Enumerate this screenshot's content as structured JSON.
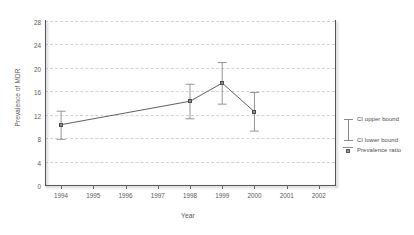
{
  "chart_data": {
    "type": "line",
    "title": "",
    "xlabel": "Year",
    "ylabel": "Prevalence of MDR",
    "x": [
      1994,
      1995,
      1996,
      1997,
      1998,
      1999,
      2000,
      2001,
      2002
    ],
    "xtick_labels": [
      "1994",
      "1995",
      "1996",
      "1997",
      "1998",
      "1999",
      "2000",
      "2001",
      "2002"
    ],
    "ytick_labels": [
      "0",
      "4",
      "8",
      "12",
      "16",
      "20",
      "24",
      "28"
    ],
    "yticks": [
      0,
      4,
      8,
      12,
      16,
      20,
      24,
      28
    ],
    "ylim": [
      0,
      28
    ],
    "xlim": [
      1993.5,
      2002.5
    ],
    "grid": "horizontal-dashed",
    "legend_position": "right-outside",
    "series": [
      {
        "name": "Prevalence ratio",
        "marker": "square",
        "color": "#8d8d8d",
        "points": [
          {
            "x": 1994,
            "value": 10.3,
            "ci_lower": 7.8,
            "ci_upper": 12.6
          },
          {
            "x": 1998,
            "value": 14.3,
            "ci_lower": 11.3,
            "ci_upper": 17.2
          },
          {
            "x": 1999,
            "value": 17.4,
            "ci_lower": 13.8,
            "ci_upper": 20.9
          },
          {
            "x": 2000,
            "value": 12.5,
            "ci_lower": 9.2,
            "ci_upper": 15.8
          }
        ]
      }
    ],
    "legend": [
      {
        "label": "CI upper bound",
        "icon": "error-bar-upper-icon"
      },
      {
        "label": "CI lower bound",
        "icon": "error-bar-lower-icon"
      },
      {
        "label": "Prevalence ratio",
        "icon": "square-marker-icon"
      }
    ]
  }
}
